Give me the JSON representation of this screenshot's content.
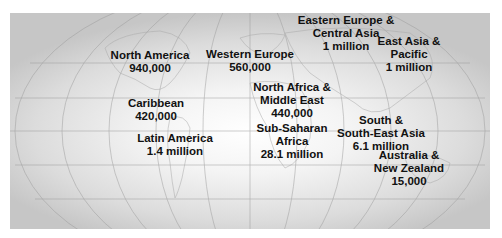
{
  "map": {
    "projection": "elliptical world projection with graticule",
    "regions": [
      {
        "id": "north-america",
        "name": "North America",
        "value": "940,000",
        "x": 140,
        "y": 36
      },
      {
        "id": "caribbean",
        "name": "Caribbean",
        "value": "420,000",
        "x": 156,
        "y": 97
      },
      {
        "id": "latin-america",
        "name": "Latin America",
        "value": "1.4 million",
        "x": 175,
        "y": 132
      },
      {
        "id": "western-europe",
        "name": "Western Europe",
        "value": "560,000",
        "x": 252,
        "y": 48
      },
      {
        "id": "north-africa-middle-east",
        "name": "North Africa & Middle East",
        "line1": "North Africa &",
        "line2": "Middle East",
        "value": "440,000",
        "x": 292,
        "y": 80
      },
      {
        "id": "sub-saharan-africa",
        "name": "Sub-Saharan Africa",
        "line1": "Sub-Saharan",
        "line2": "Africa",
        "value": "28.1 million",
        "x": 292,
        "y": 122
      },
      {
        "id": "eastern-europe-central-asia",
        "name": "Eastern Europe & Central Asia",
        "line1": "Eastern Europe &",
        "line2": "Central Asia",
        "value": "1 million",
        "x": 346,
        "y": 14
      },
      {
        "id": "east-asia-pacific",
        "name": "East Asia & Pacific",
        "line1": "East Asia &",
        "line2": "Pacific",
        "value": "1 million",
        "x": 409,
        "y": 35
      },
      {
        "id": "south-southeast-asia",
        "name": "South & South-East Asia",
        "line1": "South &",
        "line2": "South-East Asia",
        "value": "6.1 million",
        "x": 391,
        "y": 115
      },
      {
        "id": "australia-new-zealand",
        "name": "Australia & New Zealand",
        "line1": "Australia &",
        "line2": "New Zealand",
        "value": "15,000",
        "x": 413,
        "y": 150
      }
    ],
    "colors": {
      "label_text": "#111111",
      "graticule": "#9a9a9a",
      "background_edge": "#c6c6c6",
      "background_center": "#ffffff"
    }
  }
}
